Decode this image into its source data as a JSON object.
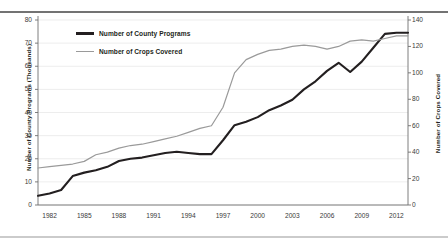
{
  "chart_data": {
    "type": "line",
    "title": "",
    "xlabel": "",
    "ylabel": "Number of County Programs (Thousands)",
    "ylabel_right": "Number of Crops Covered",
    "grid": true,
    "legend_position": "top-left-inside",
    "xlim": [
      1981,
      2013
    ],
    "ylim": [
      0,
      80
    ],
    "ylim_right": [
      0,
      140
    ],
    "xticks": [
      "1982",
      "1985",
      "1988",
      "1991",
      "1994",
      "1997",
      "2000",
      "2003",
      "2006",
      "2009",
      "2012"
    ],
    "xtick_values": [
      1982,
      1985,
      1988,
      1991,
      1994,
      1997,
      2000,
      2003,
      2006,
      2009,
      2012
    ],
    "yticks_left": [
      "0",
      "10",
      "20",
      "30",
      "40",
      "50",
      "60",
      "70",
      "80"
    ],
    "ytick_values_left": [
      0,
      10,
      20,
      30,
      40,
      50,
      60,
      70,
      80
    ],
    "yticks_right": [
      "0",
      "20",
      "40",
      "60",
      "80",
      "100",
      "120",
      "140"
    ],
    "ytick_values_right": [
      0,
      20,
      40,
      60,
      80,
      100,
      120,
      140
    ],
    "x": [
      1981,
      1982,
      1983,
      1984,
      1985,
      1986,
      1987,
      1988,
      1989,
      1990,
      1991,
      1992,
      1993,
      1994,
      1995,
      1996,
      1997,
      1998,
      1999,
      2000,
      2001,
      2002,
      2003,
      2004,
      2005,
      2006,
      2007,
      2008,
      2009,
      2010,
      2011,
      2012,
      2013
    ],
    "series": [
      {
        "name": "Number of County Programs",
        "axis": "left",
        "color": "#231f20",
        "width": 2.1,
        "values": [
          4.0,
          5.0,
          6.5,
          12.5,
          14.0,
          15.0,
          16.5,
          19.0,
          20.0,
          20.5,
          21.5,
          22.5,
          23.0,
          22.5,
          22.0,
          22.0,
          28.0,
          34.5,
          36.0,
          38.0,
          41.0,
          43.0,
          45.5,
          50.0,
          53.5,
          58.0,
          61.5,
          57.5,
          62.0,
          68.0,
          74.0,
          74.5,
          74.5
        ]
      },
      {
        "name": "Number of Crops Covered",
        "axis": "right",
        "color": "#9a9a9a",
        "width": 1.2,
        "values": [
          28,
          29,
          30,
          31,
          33,
          38,
          40,
          43,
          45,
          46,
          48,
          50,
          52,
          55,
          58,
          60,
          74,
          100,
          110,
          114,
          117,
          118,
          120,
          121,
          120,
          118,
          120,
          124,
          125,
          124,
          126,
          128,
          128
        ]
      }
    ]
  },
  "legend": {
    "items": [
      {
        "label": "Number of County Programs",
        "color": "#231f20"
      },
      {
        "label": "Number of Crops Covered",
        "color": "#9a9a9a"
      }
    ]
  }
}
